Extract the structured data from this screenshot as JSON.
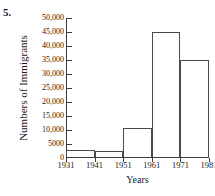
{
  "problem": {
    "number_label": "5."
  },
  "chart_data": {
    "type": "bar",
    "title": "",
    "xlabel": "Years",
    "ylabel": "Numbers of Immigrants",
    "bin_edges": [
      1931,
      1941,
      1951,
      1961,
      1971,
      1981
    ],
    "categories": [
      "1931-1941",
      "1941-1951",
      "1951-1961",
      "1961-1971",
      "1971-1981"
    ],
    "values": [
      2500,
      2000,
      10300,
      44500,
      34700
    ],
    "xtick_labels": [
      "1931",
      "1941",
      "1951",
      "1961",
      "1971",
      "1981"
    ],
    "ytick_labels": [
      "50,000",
      "45,000",
      "40,000",
      "35,000",
      "30,000",
      "25,000",
      "20,000",
      "15,000",
      "10,000",
      "5000",
      "0"
    ],
    "ytick_values": [
      50000,
      45000,
      40000,
      35000,
      30000,
      25000,
      20000,
      15000,
      10000,
      5000,
      0
    ],
    "ylim": [
      0,
      50000
    ],
    "xlim": [
      1931,
      1981
    ],
    "grid": false,
    "legend": false,
    "bar_style": "outlined-unfilled",
    "colors": {
      "axis": "#3b3b3b",
      "bar_outline": "#4a4a4a",
      "bar_fill": "transparent",
      "text": "#1a1a1a",
      "background": "#ffffff"
    }
  }
}
